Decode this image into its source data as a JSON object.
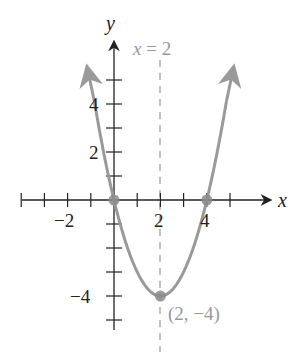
{
  "chart_data": {
    "type": "line",
    "title": "",
    "function": "y = x^2 - 4x",
    "xlabel": "x",
    "ylabel": "y",
    "xlim": [
      -4,
      5
    ],
    "ylim": [
      -5,
      5
    ],
    "x_ticks": [
      -4,
      -3,
      -2,
      -1,
      1,
      2,
      3,
      4,
      5
    ],
    "y_ticks": [
      -5,
      -4,
      -3,
      -2,
      -1,
      1,
      2,
      3,
      4,
      5
    ],
    "x_tick_labels": [
      {
        "value": -2,
        "text": "−2"
      },
      {
        "value": 2,
        "text": "2"
      },
      {
        "value": 4,
        "text": "4"
      }
    ],
    "y_tick_labels": [
      {
        "value": 4,
        "text": "4"
      },
      {
        "value": 2,
        "text": "2"
      },
      {
        "value": -4,
        "text": "−4"
      }
    ],
    "series": [
      {
        "name": "parabola",
        "x": [
          -0.9,
          -0.5,
          0,
          0.5,
          1,
          1.5,
          2,
          2.5,
          3,
          3.5,
          4,
          4.5,
          4.9
        ],
        "values": [
          4.41,
          2.25,
          0,
          -1.75,
          -3,
          -3.75,
          -4,
          -3.75,
          -3,
          -1.75,
          0,
          2.25,
          4.41
        ]
      }
    ],
    "points": [
      {
        "x": 0,
        "y": 0,
        "label": ""
      },
      {
        "x": 4,
        "y": 0,
        "label": ""
      },
      {
        "x": 2,
        "y": -4,
        "label": "(2, −4)"
      }
    ],
    "axis_of_symmetry": {
      "x": 2,
      "label": "x = 2",
      "style": "dashed"
    },
    "grid": false,
    "legend": "none",
    "colors": {
      "curve": "#9a9a9a",
      "axis": "#222222",
      "annotation": "#999999",
      "point": "#8a8a8a"
    }
  },
  "labels": {
    "x_axis": "x",
    "y_axis": "y",
    "symmetry": "x = 2",
    "vertex": "(2, −4)",
    "x_neg2": "−2",
    "x_2": "2",
    "x_4": "4",
    "y_4": "4",
    "y_2": "2",
    "y_neg4": "−4"
  }
}
